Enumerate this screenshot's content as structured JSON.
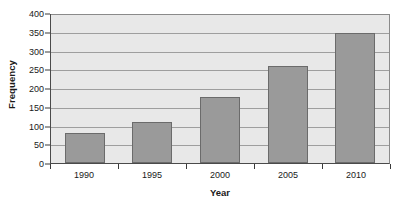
{
  "chart_data": {
    "type": "bar",
    "title": "",
    "xlabel": "Year",
    "ylabel": "Frequency",
    "categories": [
      "1990",
      "1995",
      "2000",
      "2005",
      "2010"
    ],
    "values": [
      80,
      110,
      175,
      258,
      348
    ],
    "series": [
      {
        "name": "Frequency",
        "values": [
          80,
          110,
          175,
          258,
          348
        ]
      }
    ],
    "ylim": [
      0,
      400
    ],
    "ytick_step": 50,
    "yticks": [
      "400",
      "350",
      "300",
      "250",
      "200",
      "150",
      "100",
      "50",
      "0"
    ],
    "ytick_values": [
      400,
      350,
      300,
      250,
      200,
      150,
      100,
      50,
      0
    ],
    "grid": true,
    "grid_axis": "y",
    "legend": false,
    "legend_position": "none",
    "colors": {
      "bar_fill": "#9a9a9a",
      "bar_outline": "#6b6b6b",
      "plot_background": "#e8e8e8",
      "gridline": "#9e9e9e",
      "axis_line": "#4a4a4a",
      "text": "#1a1a1a",
      "figure_background": "#ffffff"
    }
  }
}
